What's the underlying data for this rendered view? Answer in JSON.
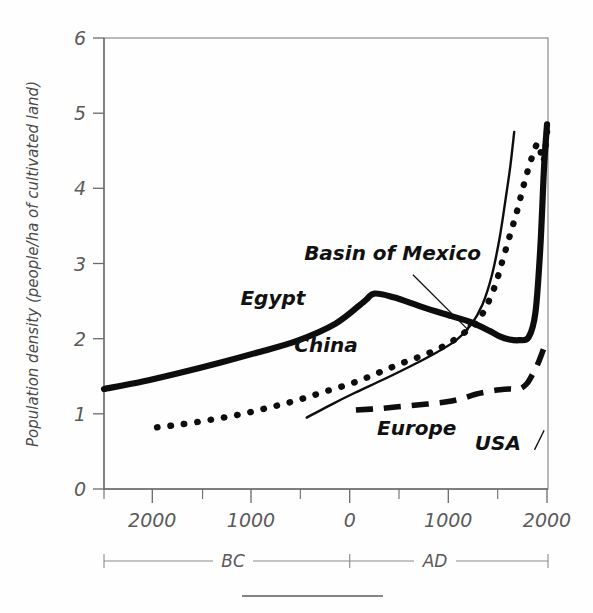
{
  "chart_data": {
    "type": "line",
    "title": "",
    "xlabel": "",
    "ylabel": "Population density (people/ha of cultivated land)",
    "xlim": [
      -2600,
      2000
    ],
    "ylim": [
      0,
      6
    ],
    "grid": false,
    "legend_position": "inline-labels",
    "y_ticks": [
      "0",
      "1",
      "2",
      "3",
      "4",
      "5",
      "6"
    ],
    "y_tick_values": [
      0,
      1,
      2,
      3,
      4,
      5,
      6
    ],
    "x_ticks": [
      "2000",
      "1000",
      "0",
      "1000",
      "2000"
    ],
    "x_tick_values": [
      -2000,
      -1000,
      0,
      1000,
      2000
    ],
    "x_minor_values": [
      -1500,
      -500,
      500,
      1500
    ],
    "era_labels": [
      "BC",
      "AD"
    ],
    "era_divider_value": 0,
    "series": [
      {
        "name": "Egypt",
        "style": "thick-solid",
        "label": "Egypt",
        "label_x": -850,
        "label_y": 2.45,
        "x": [
          -2600,
          -2200,
          -1800,
          -1400,
          -1000,
          -600,
          -200,
          100,
          200,
          400,
          700,
          1000,
          1200,
          1400,
          1500,
          1600,
          1700,
          1800,
          1870,
          1920,
          1960,
          1990
        ],
        "y": [
          1.33,
          1.43,
          1.55,
          1.68,
          1.82,
          1.97,
          2.2,
          2.5,
          2.6,
          2.55,
          2.42,
          2.3,
          2.22,
          2.1,
          2.03,
          1.99,
          1.98,
          2.02,
          2.35,
          3.2,
          4.3,
          4.85
        ]
      },
      {
        "name": "China",
        "style": "dotted",
        "label": "China",
        "label_x": -300,
        "label_y": 1.82,
        "x": [
          -2050,
          -1800,
          -1500,
          -1200,
          -900,
          -600,
          -300,
          0,
          250,
          500,
          750,
          950,
          1100,
          1250,
          1350,
          1450,
          1520,
          1600,
          1680,
          1750,
          1830,
          1900,
          1950,
          1990
        ],
        "y": [
          0.82,
          0.86,
          0.92,
          0.99,
          1.08,
          1.18,
          1.3,
          1.42,
          1.55,
          1.68,
          1.8,
          1.92,
          2.05,
          2.2,
          2.4,
          2.7,
          3.0,
          3.35,
          3.7,
          4.05,
          4.4,
          4.6,
          4.35,
          4.75
        ]
      },
      {
        "name": "Basin of Mexico",
        "style": "thin-solid",
        "label": "Basin of Mexico",
        "label_x": 390,
        "label_y": 3.05,
        "x": [
          -500,
          -250,
          0,
          300,
          600,
          850,
          1050,
          1200,
          1320,
          1420,
          1500,
          1560,
          1610,
          1650
        ],
        "y": [
          0.95,
          1.12,
          1.28,
          1.46,
          1.65,
          1.82,
          1.98,
          2.18,
          2.45,
          2.85,
          3.35,
          3.85,
          4.3,
          4.75
        ]
      },
      {
        "name": "Europe",
        "style": "dashed",
        "label": "Europe",
        "label_x": 640,
        "label_y": 0.72,
        "x": [
          10,
          250,
          500,
          750,
          950,
          1100,
          1250,
          1400,
          1500,
          1600,
          1700,
          1780,
          1850,
          1900,
          1950,
          1990
        ],
        "y": [
          1.05,
          1.07,
          1.1,
          1.13,
          1.16,
          1.2,
          1.26,
          1.3,
          1.32,
          1.33,
          1.33,
          1.4,
          1.55,
          1.68,
          1.85,
          2.0
        ]
      },
      {
        "name": "USA",
        "style": "pointer-only",
        "label": "USA",
        "label_x": 1480,
        "label_y": 0.52
      }
    ],
    "annotations": [
      {
        "name": "basin-of-mexico-arrow",
        "from_x": 600,
        "from_y": 2.85,
        "to_x": 1170,
        "to_y": 2.12
      },
      {
        "name": "usa-pointer",
        "from_x": 1860,
        "from_y": 0.52,
        "to_x": 1960,
        "to_y": 0.78
      }
    ]
  },
  "colors": {
    "background": "#fefefe",
    "ink": "#0d0d0d",
    "axis": "#6b6b6b",
    "frame": "#8a8a8a",
    "label_text": "#5a5a5a"
  }
}
